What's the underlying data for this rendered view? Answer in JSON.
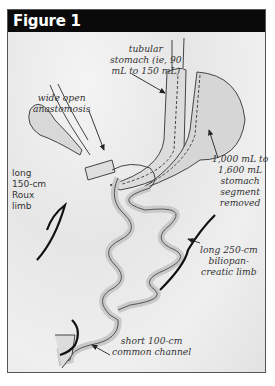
{
  "figure": {
    "title": "Figure 1",
    "labels": {
      "tubular_stomach": [
        "tubular",
        "stomach (ie, 90",
        "mL to 150 mL)"
      ],
      "anastomosis": [
        "wide open",
        "anastomosis"
      ],
      "stomach_removed": [
        "1,000 mL to",
        "1,600 mL",
        "stomach",
        "segment",
        "removed"
      ],
      "roux_limb": [
        "long",
        "150-cm",
        "Roux",
        "limb"
      ],
      "biliopancreatic_limb": [
        "long 250-cm",
        "biliopan-",
        "creatic limb"
      ],
      "common_channel": [
        "short 100-cm",
        "common channel"
      ]
    }
  },
  "colors": {
    "title_bg": "#0a0a0a",
    "title_fg": "#ffffff",
    "background": "#ebebeb",
    "line": "#333333"
  }
}
